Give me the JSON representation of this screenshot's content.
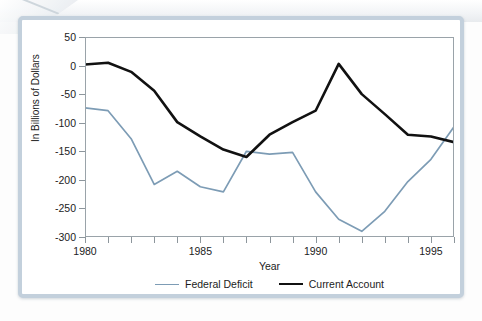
{
  "figure": {
    "title": "Account for the U.S., 1980-1996",
    "title_clipped": true
  },
  "axes": {
    "ylabel": "In Billions of Dollars",
    "xlabel": "Year",
    "y_ticks": [
      50,
      0,
      -50,
      -100,
      -150,
      -200,
      -250,
      -300
    ],
    "y_tick_labels": [
      "50",
      "0",
      "-50",
      "-100",
      "-150",
      "-200",
      "-250",
      "-300"
    ],
    "ylim": [
      -300,
      50
    ],
    "xlim": [
      1980,
      1996
    ],
    "x_ticks": [
      1980,
      1981,
      1982,
      1983,
      1984,
      1985,
      1986,
      1987,
      1988,
      1989,
      1990,
      1991,
      1992,
      1993,
      1994,
      1995,
      1996
    ],
    "x_tick_labels": [
      "1980",
      "1985",
      "1990",
      "1995"
    ],
    "x_labeled_ticks": [
      1980,
      1985,
      1990,
      1995
    ],
    "grid": false
  },
  "legend": {
    "position": "below-axis-center",
    "items": [
      {
        "label": "Federal Deficit",
        "color": "#7d9cb5"
      },
      {
        "label": "Current Account",
        "color": "#111111"
      }
    ]
  },
  "chart_data": {
    "type": "line",
    "title": "Account for the U.S., 1980-1996",
    "xlabel": "Year",
    "ylabel": "In Billions of Dollars",
    "xlim": [
      1980,
      1996
    ],
    "ylim": [
      -300,
      50
    ],
    "grid": false,
    "x": [
      1980,
      1981,
      1982,
      1983,
      1984,
      1985,
      1986,
      1987,
      1988,
      1989,
      1990,
      1991,
      1992,
      1993,
      1994,
      1995,
      1996
    ],
    "series": [
      {
        "name": "Federal Deficit",
        "color": "#7d9cb5",
        "values": [
          -74,
          -79,
          -128,
          -208,
          -185,
          -212,
          -221,
          -150,
          -155,
          -152,
          -221,
          -269,
          -290,
          -255,
          -203,
          -164,
          -107
        ]
      },
      {
        "name": "Current Account",
        "color": "#111111",
        "values": [
          2,
          5,
          -11,
          -44,
          -99,
          -124,
          -147,
          -160,
          -121,
          -99,
          -79,
          3,
          -50,
          -85,
          -121,
          -124,
          -134
        ]
      }
    ]
  },
  "colors": {
    "federal_deficit": "#7d9cb5",
    "current_account": "#111111",
    "frame_border": "#c3d0dc",
    "axis": "#9aa3a9",
    "text": "#1c1c1c"
  }
}
